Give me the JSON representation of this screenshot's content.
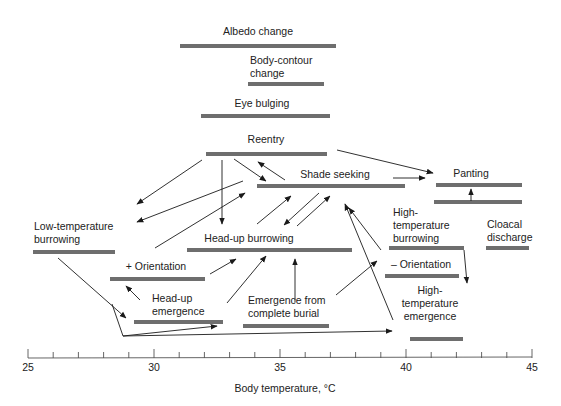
{
  "diagram": {
    "axis": {
      "title": "Body temperature, °C",
      "min": 25,
      "max": 45,
      "major_ticks": [
        "25",
        "30",
        "35",
        "40",
        "45"
      ],
      "minor_step": 0.5,
      "px_start": 28,
      "px_end": 532,
      "y": 358
    },
    "behaviors": [
      {
        "id": "albedo",
        "label_lines": [
          "Albedo change"
        ],
        "x1": 180,
        "x2": 336,
        "y": 46,
        "lx": 258,
        "ly": 35,
        "anchor": "middle"
      },
      {
        "id": "body-contour",
        "label_lines": [
          "Body-contour",
          "change"
        ],
        "x1": 248,
        "x2": 324,
        "y": 84,
        "lx": 250,
        "ly": 64,
        "anchor": "start"
      },
      {
        "id": "eye-bulging",
        "label_lines": [
          "Eye bulging"
        ],
        "x1": 201,
        "x2": 330,
        "y": 116,
        "lx": 262,
        "ly": 107,
        "anchor": "middle"
      },
      {
        "id": "reentry",
        "label_lines": [
          "Reentry"
        ],
        "x1": 206,
        "x2": 327,
        "y": 154,
        "lx": 266,
        "ly": 143,
        "anchor": "middle"
      },
      {
        "id": "shade-seeking",
        "label_lines": [
          "Shade seeking"
        ],
        "x1": 257,
        "x2": 405,
        "y": 186,
        "lx": 335,
        "ly": 178,
        "anchor": "middle"
      },
      {
        "id": "panting",
        "label_lines": [
          "Panting"
        ],
        "x1": 436,
        "x2": 522,
        "y": 185,
        "lx": 471,
        "ly": 177,
        "anchor": "middle"
      },
      {
        "id": "panting-lower",
        "label_lines": [],
        "x1": 434,
        "x2": 522,
        "y": 202,
        "lx": 0,
        "ly": 0,
        "anchor": "start"
      },
      {
        "id": "low-temp-burrowing",
        "label_lines": [
          "Low-temperature",
          "burrowing"
        ],
        "x1": 33,
        "x2": 115,
        "y": 252,
        "lx": 34,
        "ly": 230,
        "anchor": "start"
      },
      {
        "id": "head-up-burrowing",
        "label_lines": [
          "Head-up burrowing"
        ],
        "x1": 187,
        "x2": 352,
        "y": 250,
        "lx": 249,
        "ly": 242,
        "anchor": "middle"
      },
      {
        "id": "high-temp-burrowing",
        "label_lines": [
          "High-",
          "temperature",
          "burrowing"
        ],
        "x1": 389,
        "x2": 464,
        "y": 248,
        "lx": 393,
        "ly": 216,
        "anchor": "start"
      },
      {
        "id": "cloacal-discharge",
        "label_lines": [
          "Cloacal",
          "discharge"
        ],
        "x1": 486,
        "x2": 529,
        "y": 248,
        "lx": 487,
        "ly": 228,
        "anchor": "start"
      },
      {
        "id": "plus-orientation",
        "label_lines": [
          "+ Orientation"
        ],
        "x1": 110,
        "x2": 205,
        "y": 279,
        "lx": 156,
        "ly": 270,
        "anchor": "middle"
      },
      {
        "id": "minus-orientation",
        "label_lines": [
          "– Orientation"
        ],
        "x1": 385,
        "x2": 459,
        "y": 276,
        "lx": 421,
        "ly": 268,
        "anchor": "middle"
      },
      {
        "id": "head-up-emergence",
        "label_lines": [
          "Head-up",
          "emergence"
        ],
        "x1": 134,
        "x2": 223,
        "y": 322,
        "lx": 152,
        "ly": 302,
        "anchor": "start"
      },
      {
        "id": "emergence-complete-burial",
        "label_lines": [
          "Emergence from",
          "complete burial"
        ],
        "x1": 243,
        "x2": 329,
        "y": 326,
        "lx": 248,
        "ly": 304,
        "anchor": "start"
      },
      {
        "id": "high-temp-emergence",
        "label_lines": [
          "High-",
          "temperature",
          "emergence"
        ],
        "x1": 410,
        "x2": 463,
        "y": 339,
        "lx": 430,
        "ly": 294,
        "anchor": "middle"
      }
    ],
    "arrows": [
      {
        "from": "reentry",
        "to": "low-temp-burrowing",
        "points": [
          [
            202,
            160
          ],
          [
            137,
            204
          ]
        ]
      },
      {
        "from": "shade-seeking",
        "to": "low-temp-burrowing",
        "points": [
          [
            243,
            181
          ],
          [
            137,
            222
          ]
        ]
      },
      {
        "from": "reentry",
        "to": "head-up-burrowing",
        "points": [
          [
            222,
            160
          ],
          [
            222,
            224
          ]
        ]
      },
      {
        "from": "reentry",
        "to": "shade-seeking",
        "points": [
          [
            234,
            159
          ],
          [
            266,
            181
          ]
        ]
      },
      {
        "from": "shade-seeking",
        "to": "reentry",
        "points": [
          [
            285,
            180
          ],
          [
            258,
            162
          ]
        ]
      },
      {
        "from": "reentry",
        "to": "panting",
        "points": [
          [
            337,
            150
          ],
          [
            433,
            173
          ]
        ]
      },
      {
        "from": "shade-seeking",
        "to": "panting",
        "points": [
          [
            393,
            178
          ],
          [
            425,
            178
          ]
        ]
      },
      {
        "from": "panting-lower",
        "to": "panting",
        "points": [
          [
            471,
            201
          ],
          [
            471,
            189
          ]
        ]
      },
      {
        "from": "plus-orientation",
        "to": "shade-seeking",
        "points": [
          [
            155,
            248
          ],
          [
            245,
            193
          ]
        ]
      },
      {
        "from": "head-up-burrowing",
        "to": "shade-seeking",
        "points": [
          [
            257,
            224
          ],
          [
            291,
            196
          ]
        ]
      },
      {
        "from": "shade-seeking",
        "to": "head-up-burrowing",
        "points": [
          [
            319,
            193
          ],
          [
            284,
            225
          ]
        ]
      },
      {
        "from": "head-up-burrowing",
        "to": "shade-seeking",
        "points": [
          [
            297,
            226
          ],
          [
            330,
            196
          ]
        ]
      },
      {
        "from": "high-temp-emergence",
        "to": "shade-seeking",
        "points": [
          [
            393,
            320
          ],
          [
            345,
            204
          ]
        ]
      },
      {
        "from": "minus-orientation",
        "to": "shade-seeking",
        "points": [
          [
            381,
            250
          ],
          [
            349,
            208
          ]
        ]
      },
      {
        "from": "plus-orientation",
        "to": "head-up-burrowing",
        "points": [
          [
            210,
            274
          ],
          [
            236,
            259
          ]
        ]
      },
      {
        "from": "head-up-emergence",
        "to": "head-up-burrowing",
        "points": [
          [
            227,
            303
          ],
          [
            266,
            256
          ]
        ]
      },
      {
        "from": "emergence-complete-burial",
        "to": "head-up-burrowing",
        "points": [
          [
            295,
            302
          ],
          [
            295,
            259
          ]
        ]
      },
      {
        "from": "emergence-complete-burial",
        "to": "high-temp-burrowing",
        "points": [
          [
            336,
            295
          ],
          [
            377,
            261
          ]
        ]
      },
      {
        "from": "high-temp-burrowing",
        "to": "high-temp-emergence",
        "points": [
          [
            464,
            250
          ],
          [
            467,
            283
          ]
        ]
      },
      {
        "from": "head-up-emergence",
        "to": "plus-orientation",
        "points": [
          [
            140,
            300
          ],
          [
            126,
            286
          ]
        ]
      },
      {
        "from": "low-temp-burrowing",
        "to": "head-up-emergence",
        "points": [
          [
            58,
            258
          ],
          [
            126,
            318
          ]
        ]
      },
      {
        "from": "low-temp-burrowing",
        "to": "head-up-emergence",
        "points": [
          [
            112,
            304
          ],
          [
            123,
            336
          ],
          [
            217,
            326
          ]
        ]
      },
      {
        "from": "low-temp-burrowing",
        "to": "high-temp-emergence",
        "points": [
          [
            123,
            336
          ],
          [
            392,
            331
          ]
        ]
      }
    ]
  }
}
